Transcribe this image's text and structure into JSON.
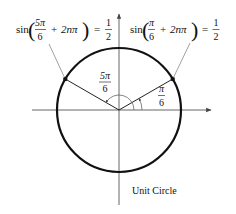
{
  "figure": {
    "caption": "Unit Circle",
    "colors": {
      "circle": "#111111",
      "axes": "#555555",
      "text": "#111111",
      "leader": "#666666"
    },
    "labels": {
      "left_equation": {
        "func": "sin",
        "frac_num": "5π",
        "frac_den": "6",
        "plus": "+",
        "term": "2nπ",
        "equals": "=",
        "rhs_num": "1",
        "rhs_den": "2"
      },
      "right_equation": {
        "func": "sin",
        "frac_num": "π",
        "frac_den": "6",
        "plus": "+",
        "term": "2nπ",
        "equals": "=",
        "rhs_num": "1",
        "rhs_den": "2"
      },
      "angle_large": {
        "num": "5π",
        "den": "6"
      },
      "angle_small": {
        "num": "π",
        "den": "6"
      }
    },
    "angles_radians": {
      "small": "π/6",
      "large": "5π/6"
    },
    "angles_degrees": [
      30,
      150
    ],
    "sine_value": 0.5
  }
}
